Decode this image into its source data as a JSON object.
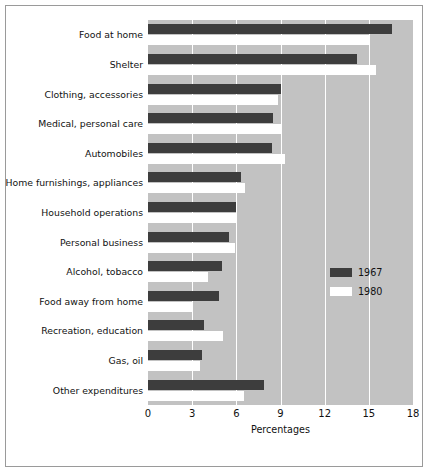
{
  "chart_data": {
    "type": "bar",
    "orientation": "horizontal",
    "title": "",
    "xlabel": "Percentages",
    "ylabel": "",
    "xlim": [
      0,
      18
    ],
    "xticks": [
      "0",
      "3",
      "6",
      "9",
      "12",
      "15",
      "18"
    ],
    "xtick_values": [
      0,
      3,
      6,
      9,
      12,
      15,
      18
    ],
    "grid": true,
    "grid_axis": "x",
    "legend_position": "center-right",
    "categories": [
      "Food at home",
      "Shelter",
      "Clothing, accessories",
      "Medical, personal care",
      "Automobiles",
      "Home furnishings, appliances",
      "Household operations",
      "Personal business",
      "Alcohol, tobacco",
      "Food away from home",
      "Recreation, education",
      "Gas, oil",
      "Other expenditures"
    ],
    "series": [
      {
        "name": "1967",
        "color": "#3d3d3d",
        "values": [
          16.6,
          14.2,
          9.0,
          8.5,
          8.4,
          6.3,
          6.0,
          5.5,
          5.0,
          4.8,
          3.8,
          3.7,
          7.9
        ]
      },
      {
        "name": "1980",
        "color": "#ffffff",
        "values": [
          15.0,
          15.5,
          8.8,
          9.1,
          9.3,
          6.6,
          6.0,
          5.9,
          4.1,
          3.0,
          5.1,
          3.5,
          6.5
        ]
      }
    ],
    "plot_background": "#c2c2c2",
    "figure_background": "#ffffff"
  }
}
